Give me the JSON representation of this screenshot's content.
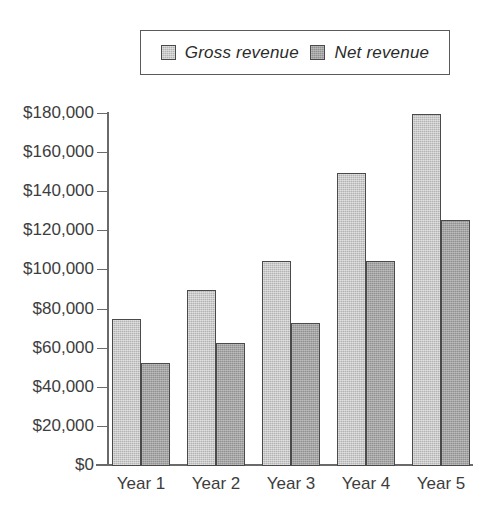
{
  "chart_data": {
    "type": "bar",
    "title": "",
    "subtitle": "",
    "xlabel": "",
    "ylabel": "",
    "categories": [
      "Year 1",
      "Year 2",
      "Year 3",
      "Year 4",
      "Year 5"
    ],
    "series": [
      {
        "name": "Gross revenue",
        "color": "#b3b3b3",
        "values": [
          75000,
          90000,
          105000,
          150000,
          180000
        ]
      },
      {
        "name": "Net revenue",
        "color": "#919191",
        "values": [
          52500,
          63000,
          73000,
          105000,
          126000
        ]
      }
    ],
    "ylim": [
      0,
      180000
    ],
    "ytick_values": [
      0,
      20000,
      40000,
      60000,
      80000,
      100000,
      120000,
      140000,
      160000,
      180000
    ],
    "ytick_labels": [
      "$0",
      "$20,000",
      "$40,000",
      "$60,000",
      "$80,000",
      "$100,000",
      "$120,000",
      "$140,000",
      "$160,000",
      "$180,000"
    ],
    "grid": false,
    "legend_position": "top"
  },
  "legend": {
    "entries": [
      {
        "label": "Gross revenue",
        "swatch": "gross-swatch"
      },
      {
        "label": "Net revenue",
        "swatch": "net-swatch"
      }
    ]
  }
}
